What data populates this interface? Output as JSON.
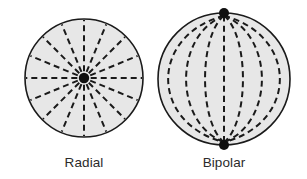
{
  "figure": {
    "type": "diagram",
    "title": "",
    "background_color": "#ffffff",
    "panels": [
      {
        "id": "radial",
        "label": "Radial",
        "pattern": "radial",
        "description": "Circle with dashed spokes radiating outward from a single central node",
        "circle": {
          "cx": 84,
          "cy": 78,
          "r": 59
        },
        "fill_color": "#e7e7e7",
        "outline_color": "#1a1a1a",
        "outline_width": 1.6,
        "line_color": "#1a1a1a",
        "line_width": 2.0,
        "dash_pattern": "6 4",
        "spoke_count": 16,
        "spoke_angles_deg": [
          0,
          22.5,
          45,
          67.5,
          90,
          112.5,
          135,
          157.5,
          180,
          202.5,
          225,
          247.5,
          270,
          292.5,
          315,
          337.5
        ],
        "hub": {
          "cx": 84,
          "cy": 78,
          "r": 5.2,
          "color": "#101010"
        },
        "label_position": {
          "x": 84,
          "y": 167
        }
      },
      {
        "id": "bipolar",
        "label": "Bipolar",
        "pattern": "bipolar",
        "description": "Circle with dashed meridian arcs converging on two opposite polar nodes",
        "circle": {
          "cx": 224,
          "cy": 79,
          "r": 66
        },
        "fill_color": "#e7e7e7",
        "outline_color": "#1a1a1a",
        "outline_width": 1.6,
        "line_color": "#1a1a1a",
        "line_width": 2.0,
        "dash_pattern": "6 4",
        "meridian_count": 7,
        "meridian_bulge_offsets": [
          -56,
          -38,
          -19,
          0,
          19,
          38,
          56
        ],
        "poles": [
          {
            "name": "north-pole",
            "cx": 224,
            "cy": 13,
            "r": 5.0,
            "color": "#101010"
          },
          {
            "name": "south-pole",
            "cx": 224,
            "cy": 145,
            "r": 5.0,
            "color": "#101010"
          }
        ],
        "label_position": {
          "x": 224,
          "y": 167
        }
      }
    ]
  },
  "colors": {
    "background": "#ffffff",
    "fill": "#e7e7e7",
    "stroke": "#1a1a1a",
    "node": "#101010",
    "caption": "#2b2b2b"
  }
}
